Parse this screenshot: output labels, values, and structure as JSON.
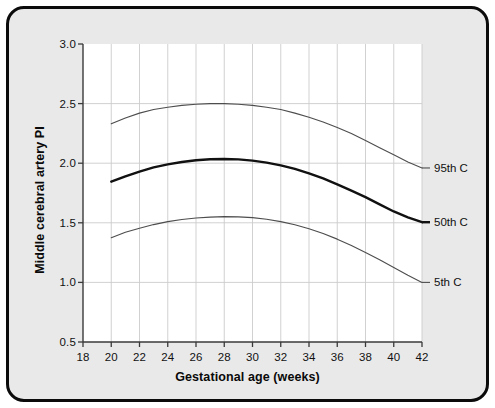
{
  "figure": {
    "background_color": "#e9e9e9",
    "border_color": "#0b0b0b",
    "plot_background_color": "#ffffff"
  },
  "chart_data": {
    "type": "line",
    "title": "",
    "subtitle": "",
    "xlabel": "Gestational age (weeks)",
    "ylabel": "Middle cerebral artery PI",
    "xlim": [
      18,
      42
    ],
    "ylim": [
      0.5,
      3.0
    ],
    "xticks": [
      18,
      20,
      22,
      24,
      26,
      28,
      30,
      32,
      34,
      36,
      38,
      40,
      42
    ],
    "yticks": [
      0.5,
      1.0,
      1.5,
      2.0,
      2.5,
      3.0
    ],
    "xtick_labels": [
      "18",
      "20",
      "22",
      "24",
      "26",
      "28",
      "30",
      "32",
      "34",
      "36",
      "38",
      "40",
      "42"
    ],
    "ytick_labels": [
      "0.5",
      "1.0",
      "1.5",
      "2.0",
      "2.5",
      "3.0"
    ],
    "grid": "vertical-and-horizontal",
    "grid_color": "#cccccc",
    "legend_position": "right-of-curve-ends",
    "x": [
      20,
      21,
      22,
      23,
      24,
      25,
      26,
      27,
      28,
      29,
      30,
      31,
      32,
      33,
      34,
      35,
      36,
      37,
      38,
      39,
      40,
      41,
      42
    ],
    "series": [
      {
        "name": "95th C",
        "label": "95th C",
        "color": "#4d4d4d",
        "line_width": 1.1,
        "values": [
          2.33,
          2.38,
          2.42,
          2.45,
          2.47,
          2.485,
          2.495,
          2.5,
          2.5,
          2.495,
          2.485,
          2.47,
          2.45,
          2.42,
          2.385,
          2.345,
          2.3,
          2.25,
          2.19,
          2.13,
          2.07,
          2.01,
          1.96
        ]
      },
      {
        "name": "50th C",
        "label": "50th C",
        "color": "#111111",
        "line_width": 2.4,
        "values": [
          1.845,
          1.89,
          1.93,
          1.965,
          1.99,
          2.01,
          2.025,
          2.033,
          2.035,
          2.032,
          2.022,
          2.005,
          1.982,
          1.952,
          1.915,
          1.872,
          1.823,
          1.77,
          1.715,
          1.655,
          1.595,
          1.545,
          1.505
        ]
      },
      {
        "name": "5th C",
        "label": "5th C",
        "color": "#4d4d4d",
        "line_width": 1.1,
        "values": [
          1.375,
          1.42,
          1.455,
          1.485,
          1.51,
          1.528,
          1.54,
          1.548,
          1.552,
          1.55,
          1.543,
          1.53,
          1.51,
          1.483,
          1.45,
          1.41,
          1.363,
          1.31,
          1.25,
          1.19,
          1.125,
          1.06,
          1.0
        ]
      }
    ]
  },
  "curve_labels": [
    {
      "name": "label-95th",
      "text": "95th C"
    },
    {
      "name": "label-50th",
      "text": "50th C"
    },
    {
      "name": "label-5th",
      "text": "5th C"
    }
  ]
}
